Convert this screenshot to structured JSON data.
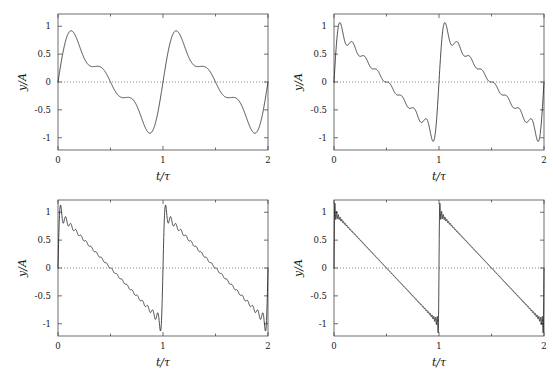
{
  "figure": {
    "title": "",
    "panels": [
      {
        "id": "panel-top-left",
        "xlabel": "t/τ",
        "ylabel": "y/A",
        "xticks": [
          "0",
          "1",
          "2"
        ],
        "xtickvals": [
          0,
          1,
          2
        ],
        "yticks": [
          "1",
          "0.5",
          "0",
          "-0.5",
          "-1"
        ],
        "ytickvals": [
          1,
          0.5,
          0,
          -0.5,
          -1
        ],
        "xlim": [
          0,
          2
        ],
        "ylim": [
          -1.22,
          1.22
        ],
        "harmonics": 3,
        "grid": false,
        "zeroline": true
      },
      {
        "id": "panel-top-right",
        "xlabel": "t/τ",
        "ylabel": "y/A",
        "xticks": [
          "0",
          "1",
          "2"
        ],
        "xtickvals": [
          0,
          1,
          2
        ],
        "yticks": [
          "1",
          "0.5",
          "0",
          "-0.5",
          "-1"
        ],
        "ytickvals": [
          1,
          0.5,
          0,
          -0.5,
          -1
        ],
        "xlim": [
          0,
          2
        ],
        "ylim": [
          -1.22,
          1.22
        ],
        "harmonics": 8,
        "grid": false,
        "zeroline": true
      },
      {
        "id": "panel-bottom-left",
        "xlabel": "t/τ",
        "ylabel": "y/A",
        "xticks": [
          "0",
          "1",
          "2"
        ],
        "xtickvals": [
          0,
          1,
          2
        ],
        "yticks": [
          "1",
          "0.5",
          "0",
          "-0.5",
          "-1"
        ],
        "ytickvals": [
          1,
          0.5,
          0,
          -0.5,
          -1
        ],
        "xlim": [
          0,
          2
        ],
        "ylim": [
          -1.22,
          1.22
        ],
        "harmonics": 20,
        "grid": false,
        "zeroline": true
      },
      {
        "id": "panel-bottom-right",
        "xlabel": "t/τ",
        "ylabel": "y/A",
        "xticks": [
          "0",
          "1",
          "2"
        ],
        "xtickvals": [
          0,
          1,
          2
        ],
        "yticks": [
          "1",
          "0.5",
          "0",
          "-0.5",
          "-1"
        ],
        "ytickvals": [
          1,
          0.5,
          0,
          -0.5,
          -1
        ],
        "xlim": [
          0,
          2
        ],
        "ylim": [
          -1.22,
          1.22
        ],
        "harmonics": 60,
        "grid": false,
        "zeroline": true
      }
    ]
  },
  "chart_data": {
    "type": "line",
    "title": "",
    "xlabel": "t/τ",
    "ylabel": "y/A",
    "xlim": [
      0,
      2
    ],
    "ylim": [
      -1.22,
      1.22
    ],
    "xticks": [
      0,
      1,
      2
    ],
    "yticks": [
      1,
      0.5,
      0,
      -0.5,
      -1
    ],
    "grid": false,
    "legend": "none",
    "series": [
      {
        "name": "N = 3 harmonics",
        "panel": "panel-top-left",
        "harmonics": 3,
        "peak": 0.97,
        "trough": -0.97
      },
      {
        "name": "N = 8 harmonics",
        "panel": "panel-top-right",
        "harmonics": 8,
        "peak": 1.07,
        "trough": -1.07
      },
      {
        "name": "N = 20 harmonics",
        "panel": "panel-bottom-left",
        "harmonics": 20,
        "peak": 1.11,
        "trough": -1.11
      },
      {
        "name": "N = 60 harmonics",
        "panel": "panel-bottom-right",
        "harmonics": 60,
        "peak": 1.15,
        "trough": -1.15
      }
    ]
  }
}
